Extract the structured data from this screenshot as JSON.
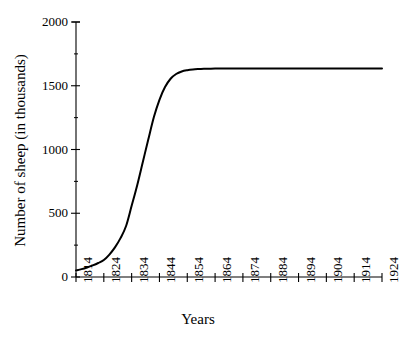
{
  "chart_data": {
    "type": "line",
    "title": "",
    "xlabel": "Years",
    "ylabel": "Number of sheep (in thousands)",
    "xlim": [
      1814,
      1924
    ],
    "ylim": [
      0,
      2000
    ],
    "grid": false,
    "legend": "none",
    "x_tick_labels": [
      "1814",
      "1824",
      "1834",
      "1844",
      "1854",
      "1864",
      "1874",
      "1884",
      "1894",
      "1904",
      "1914",
      "1924"
    ],
    "x_ticks": [
      1814,
      1824,
      1834,
      1844,
      1854,
      1864,
      1874,
      1884,
      1894,
      1904,
      1914,
      1924
    ],
    "y_tick_labels": [
      "0",
      "500",
      "1000",
      "1500",
      "2000"
    ],
    "y_ticks": [
      0,
      500,
      1000,
      1500,
      2000
    ],
    "y_minor_ticks": [
      250,
      750,
      1250,
      1750
    ],
    "line_color": "#000000",
    "line_width": 2.0,
    "axis_color": "#000000",
    "series": [
      {
        "name": "Sheep population",
        "x": [
          1814,
          1816,
          1818,
          1820,
          1822,
          1824,
          1826,
          1828,
          1830,
          1832,
          1834,
          1836,
          1838,
          1840,
          1842,
          1844,
          1846,
          1848,
          1850,
          1852,
          1854,
          1856,
          1858,
          1860,
          1862,
          1864,
          1870,
          1880,
          1890,
          1900,
          1910,
          1920,
          1924
        ],
        "y": [
          52,
          62,
          75,
          91,
          110,
          133,
          176,
          232,
          305,
          400,
          558,
          720,
          900,
          1080,
          1255,
          1390,
          1490,
          1555,
          1592,
          1612,
          1622,
          1628,
          1631,
          1633,
          1634,
          1635,
          1636,
          1636,
          1636,
          1636,
          1636,
          1636,
          1636
        ]
      }
    ]
  },
  "axes": {
    "y_axis_name": "y-axis",
    "x_axis_name": "x-axis"
  }
}
